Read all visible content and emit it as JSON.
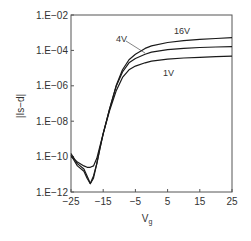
{
  "chart_data": {
    "type": "line",
    "title": "",
    "xlabel": "V",
    "xlabel_sub": "g",
    "ylabel": "|Is−d|",
    "yscale": "log",
    "xlim": [
      -25,
      25
    ],
    "ylim": [
      1e-12,
      0.01
    ],
    "grid": false,
    "legend": "inline labels",
    "x_ticks": [
      -25,
      -15,
      -5,
      5,
      15,
      25
    ],
    "x_tick_labels": [
      "−25",
      "−15",
      "−5",
      "5",
      "15",
      "25"
    ],
    "y_ticks": [
      1e-12,
      1e-10,
      1e-08,
      1e-06,
      0.0001,
      0.01
    ],
    "y_tick_labels": [
      "1.E−12",
      "1.E−10",
      "1.E−08",
      "1.E−06",
      "1.E−04",
      "1.E−02"
    ],
    "x": [
      -25,
      -23,
      -21,
      -20,
      -19,
      -18,
      -17,
      -16,
      -15,
      -13,
      -11,
      -9,
      -7,
      -5,
      -2,
      0,
      5,
      10,
      15,
      20,
      25
    ],
    "series": [
      {
        "name": "16V",
        "label": "16V",
        "values": [
          1.5e-10,
          4e-11,
          2e-11,
          8e-12,
          3e-12,
          6e-12,
          4e-11,
          3e-10,
          2e-09,
          5e-08,
          1e-06,
          8e-06,
          3e-05,
          6e-05,
          0.00013,
          0.00018,
          0.00028,
          0.00036,
          0.00042,
          0.00047,
          0.00052
        ]
      },
      {
        "name": "4V",
        "label": "4V",
        "values": [
          1.2e-10,
          3e-11,
          1.5e-11,
          6e-12,
          3e-12,
          8e-12,
          4e-11,
          3e-10,
          2e-09,
          5e-08,
          9e-07,
          6e-06,
          2e-05,
          3.5e-05,
          6e-05,
          8e-05,
          0.00011,
          0.00013,
          0.000145,
          0.000155,
          0.000165
        ]
      },
      {
        "name": "1V",
        "label": "1V",
        "values": [
          1e-10,
          5e-11,
          3e-11,
          2.5e-11,
          2.5e-11,
          3e-11,
          8e-11,
          4e-10,
          2e-09,
          4e-08,
          5e-07,
          3e-06,
          8e-06,
          1.3e-05,
          2e-05,
          2.5e-05,
          3.2e-05,
          3.7e-05,
          4.1e-05,
          4.4e-05,
          4.7e-05
        ]
      }
    ]
  },
  "labels": {
    "s16": "16V",
    "s4": "4V",
    "s1": "1V",
    "ylabel": "|Is−d|",
    "xlabel": "V",
    "xlabel_sub": "g"
  },
  "colors": {
    "line": "#1a1a1a",
    "frame": "#555555",
    "text": "#333333"
  }
}
